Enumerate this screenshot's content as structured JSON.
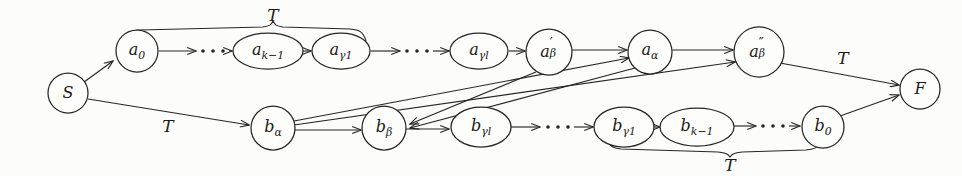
{
  "figure": {
    "type": "state-transition-diagram",
    "background_color": "#fcfcfb",
    "ink_color": "#262626",
    "width": 962,
    "height": 176,
    "nodes": [
      {
        "id": "S",
        "label": "S",
        "base": "S",
        "sup": "",
        "sub": "",
        "shape": "circle",
        "cx": 68,
        "cy": 93,
        "rx": 20,
        "ry": 20
      },
      {
        "id": "a0",
        "label": "a0",
        "base": "a",
        "sup": "",
        "sub": "0",
        "shape": "circle",
        "cx": 137,
        "cy": 51,
        "rx": 21,
        "ry": 21
      },
      {
        "id": "ak1",
        "label": "ak-1",
        "base": "a",
        "sup": "",
        "sub": "k−1",
        "shape": "ellipse",
        "cx": 268,
        "cy": 51,
        "rx": 35,
        "ry": 18
      },
      {
        "id": "ag1",
        "label": "agamma1",
        "base": "a",
        "sup": "",
        "sub": "γ1",
        "shape": "ellipse",
        "cx": 341,
        "cy": 51,
        "rx": 29,
        "ry": 18
      },
      {
        "id": "agl",
        "label": "agammal",
        "base": "a",
        "sup": "",
        "sub": "γl",
        "shape": "ellipse",
        "cx": 479,
        "cy": 51,
        "rx": 29,
        "ry": 18
      },
      {
        "id": "abprime",
        "label": "aprimebeta",
        "base": "a",
        "sup": "′",
        "sub": "β",
        "shape": "circle",
        "cx": 549,
        "cy": 52,
        "rx": 23,
        "ry": 23
      },
      {
        "id": "aalpha",
        "label": "aalpha",
        "base": "a",
        "sup": "",
        "sub": "α",
        "shape": "circle",
        "cx": 650,
        "cy": 52,
        "rx": 22,
        "ry": 22
      },
      {
        "id": "abdprime",
        "label": "adblprimebeta",
        "base": "a",
        "sup": "″",
        "sub": "β",
        "shape": "circle",
        "cx": 759,
        "cy": 52,
        "rx": 25,
        "ry": 25
      },
      {
        "id": "balpha",
        "label": "balpha",
        "base": "b",
        "sup": "",
        "sub": "α",
        "shape": "circle",
        "cx": 273,
        "cy": 128,
        "rx": 22,
        "ry": 22
      },
      {
        "id": "bbeta",
        "label": "bbeta",
        "base": "b",
        "sup": "",
        "sub": "β",
        "shape": "circle",
        "cx": 384,
        "cy": 128,
        "rx": 22,
        "ry": 22
      },
      {
        "id": "bgl",
        "label": "bgammal",
        "base": "b",
        "sup": "",
        "sub": "γl",
        "shape": "ellipse",
        "cx": 481,
        "cy": 127,
        "rx": 30,
        "ry": 20
      },
      {
        "id": "bg1",
        "label": "bgamma1",
        "base": "b",
        "sup": "",
        "sub": "γ1",
        "shape": "ellipse",
        "cx": 624,
        "cy": 127,
        "rx": 30,
        "ry": 20
      },
      {
        "id": "bk1",
        "label": "bk-1",
        "base": "b",
        "sup": "",
        "sub": "k−1",
        "shape": "ellipse",
        "cx": 697,
        "cy": 127,
        "rx": 37,
        "ry": 19
      },
      {
        "id": "b0",
        "label": "b0",
        "base": "b",
        "sup": "",
        "sub": "0",
        "shape": "circle",
        "cx": 823,
        "cy": 127,
        "rx": 21,
        "ry": 21
      },
      {
        "id": "F",
        "label": "F",
        "base": "F",
        "sup": "",
        "sub": "",
        "shape": "circle",
        "cx": 920,
        "cy": 89,
        "rx": 20,
        "ry": 20
      }
    ],
    "edges": [
      {
        "from": "S",
        "to": "a0",
        "label": "",
        "style": "solid-arrow"
      },
      {
        "from": "S",
        "to": "balpha",
        "label": "T",
        "style": "solid-arrow"
      },
      {
        "from": "a0",
        "to": "ak1",
        "label": "",
        "style": "dotted-chain"
      },
      {
        "from": "ak1",
        "to": "ag1",
        "label": "",
        "style": "solid-arrow"
      },
      {
        "from": "ag1",
        "to": "agl",
        "label": "",
        "style": "dotted-chain"
      },
      {
        "from": "agl",
        "to": "abprime",
        "label": "",
        "style": "solid-arrow"
      },
      {
        "from": "abprime",
        "to": "aalpha",
        "label": "",
        "style": "solid-arrow"
      },
      {
        "from": "aalpha",
        "to": "abdprime",
        "label": "",
        "style": "solid-arrow"
      },
      {
        "from": "abdprime",
        "to": "F",
        "label": "T",
        "style": "solid-arrow"
      },
      {
        "from": "balpha",
        "to": "bbeta",
        "label": "",
        "style": "solid-arrow"
      },
      {
        "from": "bbeta",
        "to": "bgl",
        "label": "",
        "style": "solid-arrow"
      },
      {
        "from": "bgl",
        "to": "bg1",
        "label": "",
        "style": "dotted-chain"
      },
      {
        "from": "bg1",
        "to": "bk1",
        "label": "",
        "style": "solid-arrow"
      },
      {
        "from": "bk1",
        "to": "b0",
        "label": "",
        "style": "dotted-chain"
      },
      {
        "from": "b0",
        "to": "F",
        "label": "",
        "style": "solid-arrow"
      },
      {
        "from": "abprime",
        "to": "bbeta",
        "label": "",
        "style": "cross-diagonal"
      },
      {
        "from": "aalpha",
        "to": "bbeta",
        "label": "",
        "style": "cross-diagonal"
      },
      {
        "from": "balpha",
        "to": "aalpha",
        "label": "",
        "style": "cross-diagonal"
      },
      {
        "from": "balpha",
        "to": "abdprime",
        "label": "",
        "style": "cross-diagonal"
      }
    ],
    "braces": [
      {
        "id": "top-brace",
        "label": "T",
        "orientation": "over",
        "spans": "a0..agamma1",
        "label_x": 273,
        "label_y": 15
      },
      {
        "id": "bottom-brace",
        "label": "T",
        "orientation": "under",
        "spans": "bgamma1..b0",
        "label_x": 730,
        "label_y": 163
      }
    ],
    "edge_labels": [
      {
        "id": "label-S-balpha",
        "text": "T",
        "x": 168,
        "y": 125
      },
      {
        "id": "label-abdprime-F",
        "text": "T",
        "x": 842,
        "y": 59
      }
    ],
    "ellipsis_marker": "···"
  }
}
